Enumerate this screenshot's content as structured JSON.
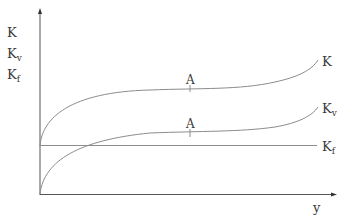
{
  "diagram": {
    "y_axis_labels": [
      "K",
      "K",
      "K"
    ],
    "y_axis_subscripts": [
      "",
      "v",
      "f"
    ],
    "x_axis_label": "y",
    "curves": [
      {
        "name": "K",
        "label": "K",
        "subscript": ""
      },
      {
        "name": "Kv",
        "label": "K",
        "subscript": "v"
      },
      {
        "name": "Kf",
        "label": "K",
        "subscript": "f"
      }
    ],
    "point_labels": [
      "A",
      "A"
    ],
    "colors": {
      "line": "#8c8c8c",
      "axis": "#555555",
      "text": "#3a3a3a"
    }
  }
}
